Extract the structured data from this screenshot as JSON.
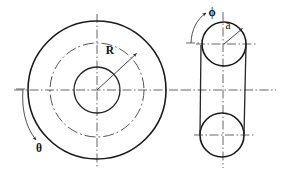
{
  "figure": {
    "background_color": "#ffffff",
    "line_color": "#1a1a1a",
    "centerline_color": "#555555",
    "width": 282,
    "height": 174
  },
  "labels": {
    "major_radius": "R",
    "minor_radius": "a",
    "toroidal_angle": "θ",
    "poloidal_angle": "ϕ"
  },
  "front_view": {
    "name": "front-view",
    "center": {
      "x": 97,
      "y": 90
    },
    "outer_circle_radius": 69,
    "centerline_circle_radius": 47,
    "inner_circle_radius": 23,
    "radius_leader": {
      "from": {
        "x": 97,
        "y": 90
      },
      "to": {
        "x": 137,
        "y": 53
      },
      "label": "R"
    },
    "angle_arc": {
      "label": "θ",
      "label_position": {
        "x": 39,
        "y": 146
      },
      "direction": "counterclockwise-downward"
    }
  },
  "side_view": {
    "name": "side-view",
    "top_circle": {
      "cx": 224,
      "cy": 44,
      "r": 22
    },
    "bottom_circle": {
      "cx": 222,
      "cy": 135,
      "r": 22
    },
    "left_edge_x": 201,
    "right_edge_x": 245,
    "radius_leader": {
      "from": {
        "x": 224,
        "y": 44
      },
      "to": {
        "x": 243,
        "y": 28
      },
      "label": "a"
    },
    "angle_arc": {
      "label": "ϕ",
      "label_position": {
        "x": 211,
        "y": 17
      },
      "direction": "counterclockwise-upward"
    }
  }
}
